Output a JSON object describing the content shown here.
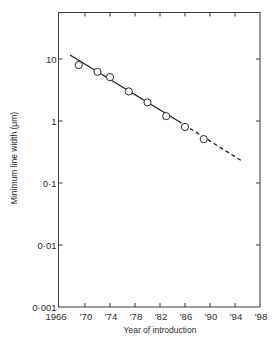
{
  "chart_data": {
    "type": "scatter",
    "title": "",
    "xlabel": "Year of introduction",
    "ylabel": "Minimum line width (μm)",
    "xscale": "linear",
    "yscale": "log",
    "xlim": [
      1966,
      1998
    ],
    "ylim": [
      0.001,
      57
    ],
    "grid": false,
    "legend": null,
    "x_ticks": [
      1966,
      1970,
      1974,
      1978,
      1982,
      1986,
      1990,
      1994,
      1998
    ],
    "x_tick_labels": [
      "1966",
      "'70",
      "'74",
      "'78",
      "'82",
      "'86",
      "'90",
      "'94",
      "'98"
    ],
    "y_ticks": [
      10,
      1,
      0.1,
      0.01,
      0.001
    ],
    "y_tick_labels": [
      "10",
      "1",
      "0·1",
      "0·01",
      "0·001"
    ],
    "series": [
      {
        "name": "Observed minimum line width",
        "marker": "open-circle",
        "x": [
          1969,
          1972,
          1974,
          1977,
          1980,
          1983,
          1986,
          1989
        ],
        "y": [
          8,
          6.2,
          5.1,
          3.0,
          2.0,
          1.2,
          0.8,
          0.51
        ]
      },
      {
        "name": "Trend (fit)",
        "style": "solid-line",
        "x": [
          1967.6,
          1984.9
        ],
        "y": [
          11.6,
          1.0
        ]
      },
      {
        "name": "Trend (extrapolation)",
        "style": "dashed-line",
        "x": [
          1984.9,
          1995
        ],
        "y": [
          1.0,
          0.23
        ]
      }
    ]
  },
  "labels": {
    "xlabel": "Year of introduction",
    "ylabel": "Minimum line width (μm)"
  }
}
